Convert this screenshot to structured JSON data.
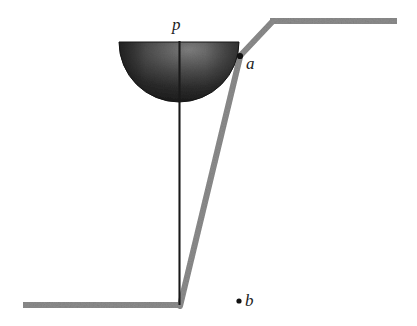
{
  "figure": {
    "type": "mechanics-diagram",
    "background_color": "#ffffff",
    "labels": {
      "pivot_label": "p",
      "point_a_label": "a",
      "point_b_label": "b"
    },
    "colors": {
      "rod_gray": "#8c8c8c",
      "rod_gray_dark": "#6f6f6f",
      "thin_rod_black": "#1a1a1a",
      "hemisphere_dark": "#1b1b1b",
      "hemisphere_mid": "#4a4a4a",
      "hemisphere_light": "#7d7d7d",
      "point_marker": "#111111",
      "label_color": "#1c1c1c"
    },
    "geometry": {
      "hemisphere": {
        "shape": "half-disk",
        "flat_edge": "top",
        "center_x": 179,
        "flat_edge_y": 42,
        "radius_x": 60,
        "radius_y": 60
      },
      "thin_rod": {
        "x": 179,
        "y_top": 42,
        "y_bottom": 304,
        "width": 2
      },
      "bent_bar": {
        "points": [
          [
            23,
            305
          ],
          [
            180,
            305
          ],
          [
            240,
            56
          ],
          [
            272,
            21
          ],
          [
            397,
            21
          ]
        ],
        "stroke_width": 6
      },
      "point_a": {
        "x": 240,
        "y": 56
      },
      "point_b": {
        "x": 239,
        "y": 301
      }
    }
  }
}
